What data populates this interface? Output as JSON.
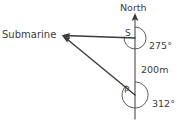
{
  "diagram": {
    "title_text": "North",
    "labels": {
      "north": "North",
      "submarine": "Submarine",
      "point_s": "S",
      "point_p": "P",
      "distance": "200m",
      "bearing_s": "275°",
      "bearing_p": "312°"
    },
    "colors": {
      "background": "#ffffff",
      "line": "#4a4a4a",
      "ray": "#3a3a3a",
      "text": "#3d3d3d"
    },
    "geometry": {
      "north_line_x": 135,
      "north_arrow_top_y": 14,
      "north_line_bottom_y": 119,
      "s_x": 135,
      "s_y": 38,
      "p_x": 135,
      "p_y": 95,
      "sub_x": 62,
      "sub_y": 35,
      "arc_s_radius": 11,
      "circle_p_radius": 13
    },
    "values": {
      "bearing_from_s": 275,
      "bearing_from_p": 312,
      "sp_distance_m": 200,
      "distance_unit": "m",
      "angle_unit": "°"
    }
  }
}
